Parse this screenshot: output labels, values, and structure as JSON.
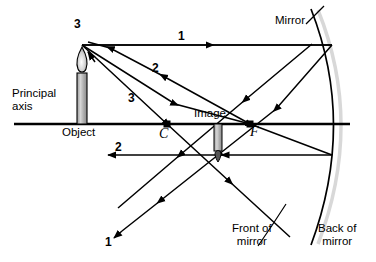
{
  "diagram": {
    "colors": {
      "ink": "#000000",
      "background": "#ffffff",
      "candle_body": "#b8b8b8",
      "candle_outline": "#000000",
      "mirror_back_shade": "#d8d8d8"
    },
    "labels": {
      "principal_axis": "Principal\naxis",
      "principal_axis_line1": "Principal",
      "principal_axis_line2": "axis",
      "object": "Object",
      "image": "Image",
      "mirror": "Mirror",
      "front_of_mirror_line1": "Front of",
      "front_of_mirror_line2": "mirror",
      "back_of_mirror_line1": "Back of",
      "back_of_mirror_line2": "mirror",
      "center_of_curvature": "C",
      "focal_point": "F",
      "ray1_incident": "1",
      "ray1_reflected": "1",
      "ray2_incident": "2",
      "ray2_reflected": "2",
      "ray3_incident": "3",
      "ray3_reflected": "3"
    },
    "geometry": {
      "axis_y": 124,
      "object_base_x": 82,
      "object_top_y": 45,
      "image_point_x": 218,
      "image_point_y": 155,
      "C_x": 167,
      "F_x": 250,
      "mirror_vertex_x": 348
    }
  }
}
